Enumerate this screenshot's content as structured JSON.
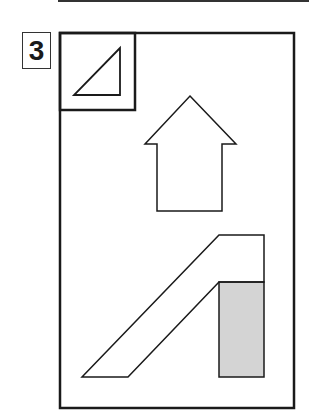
{
  "step": {
    "number": "3"
  },
  "diagram": {
    "stroke_color": "#1a1a1a",
    "fill_gray": "#d4d4d4",
    "frame": {
      "x": 60,
      "y": 33,
      "width": 234,
      "height": 375
    },
    "inset_box": {
      "x": 60,
      "y": 33,
      "width": 75,
      "height": 77
    },
    "triangle_points": "120,48 74,95 120,95",
    "up_arrow_points": "190,96 236,144 222,144 222,211 157,211 157,144 145,144",
    "ramp_points": "219,235 264,235 264,282 219,282 128,377 82,377",
    "gray_block": {
      "x": 219,
      "y": 282,
      "width": 45,
      "height": 95
    }
  }
}
